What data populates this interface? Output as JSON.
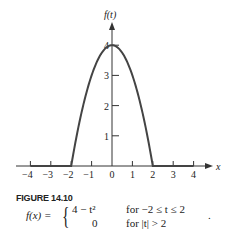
{
  "chart_data": {
    "type": "line",
    "title": "",
    "xlabel": "x",
    "ylabel": "f(t)",
    "xlim": [
      -4,
      4
    ],
    "ylim": [
      0,
      4
    ],
    "x_ticks": [
      "−4",
      "−3",
      "−2",
      "−1",
      "0",
      "1",
      "2",
      "3",
      "4"
    ],
    "y_ticks": [
      "1",
      "2",
      "3",
      "4"
    ],
    "grid": false,
    "series": [
      {
        "name": "f(t)",
        "x": [
          -4,
          -3,
          -2,
          -1.5,
          -1,
          -0.5,
          0,
          0.5,
          1,
          1.5,
          2,
          3,
          4
        ],
        "values": [
          0,
          0,
          0,
          1.75,
          3,
          3.75,
          4,
          3.75,
          3,
          1.75,
          0,
          0,
          0
        ]
      }
    ]
  },
  "figure": {
    "caption": "FIGURE 14.10",
    "formula_lhs": "f(x) =",
    "case1_expr": "4 − t²",
    "case1_cond": "for  −2 ≤ t ≤ 2",
    "case2_expr": "0",
    "case2_cond": "for |t| > 2",
    "trailing": "."
  }
}
